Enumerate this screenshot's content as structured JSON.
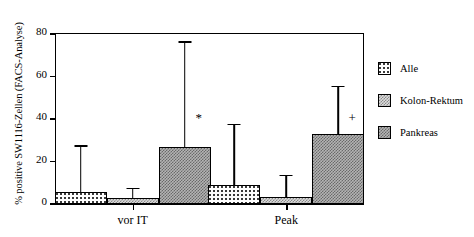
{
  "chart_data": {
    "type": "bar",
    "title": "",
    "xlabel": "",
    "ylabel": "% positive SW1116-Zellen (FACS-Analyse)",
    "categories": [
      "vor IT",
      "Peak"
    ],
    "ylim": [
      0,
      80
    ],
    "yticks": [
      0,
      20,
      40,
      60,
      80
    ],
    "ytick_labels": [
      "0",
      "20",
      "40",
      "60",
      "80"
    ],
    "grid": false,
    "legend_position": "right",
    "error_bar_style": "upper-only",
    "series": [
      {
        "name": "Alle",
        "fill": "sparse-dots",
        "values": [
          5.5,
          9.0
        ],
        "errors_upper": [
          27.0,
          37.0
        ],
        "annotations": [
          "",
          ""
        ]
      },
      {
        "name": "Kolon-Rektum",
        "fill": "medium-checker",
        "values": [
          3.0,
          3.5
        ],
        "errors_upper": [
          7.0,
          13.0
        ],
        "annotations": [
          "",
          ""
        ]
      },
      {
        "name": "Pankreas",
        "fill": "dense-checker",
        "values": [
          27.0,
          33.0
        ],
        "errors_upper": [
          76.0,
          55.0
        ],
        "annotations": [
          "*",
          "+"
        ]
      }
    ]
  },
  "legend": {
    "items": [
      {
        "label": "Alle"
      },
      {
        "label": "Kolon-Rektum"
      },
      {
        "label": "Pankreas"
      }
    ]
  },
  "colors": {
    "axis": "#000000",
    "alle": "#ffffff",
    "kolon": "#dcdcdc",
    "pankreas": "#b4b4b4"
  }
}
